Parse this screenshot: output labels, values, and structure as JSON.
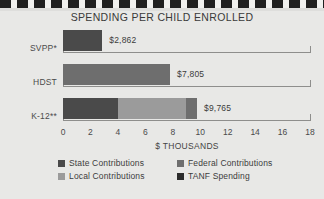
{
  "chart_data": {
    "type": "bar",
    "orientation": "horizontal",
    "stacked": true,
    "title": "SPENDING PER CHILD ENROLLED",
    "xlabel": "$ THOUSANDS",
    "ylabel": "",
    "xlim": [
      0,
      18
    ],
    "xticks": [
      0,
      2,
      4,
      6,
      8,
      10,
      12,
      14,
      16,
      18
    ],
    "xtick_labels": [
      "0",
      "2",
      "4",
      "6",
      "8",
      "10",
      "12",
      "14",
      "16",
      "18"
    ],
    "grid": false,
    "legend_position": "bottom",
    "categories": [
      "SVPP*",
      "HDST",
      "K-12**"
    ],
    "value_labels": [
      "$2,862",
      "$7,805",
      "$9,765"
    ],
    "totals": [
      2.862,
      7.805,
      9.765
    ],
    "series": [
      {
        "name": "State Contributions",
        "color": "#4a4a4a",
        "values": [
          2.862,
          0.0,
          4.0
        ]
      },
      {
        "name": "Local Contributions",
        "color": "#9b9b9b",
        "values": [
          0.0,
          0.0,
          4.95
        ]
      },
      {
        "name": "Federal Contributions",
        "color": "#6e6e6e",
        "values": [
          0.0,
          7.805,
          0.815
        ]
      },
      {
        "name": "TANF Spending",
        "color": "#2b2b2b",
        "values": [
          0.0,
          0.0,
          0.0
        ]
      }
    ],
    "legend": [
      {
        "label": "State Contributions",
        "color": "#4a4a4a"
      },
      {
        "label": "Federal Contributions",
        "color": "#6e6e6e"
      },
      {
        "label": "Local Contributions",
        "color": "#9b9b9b"
      },
      {
        "label": "TANF Spending",
        "color": "#2b2b2b"
      }
    ],
    "colors": {
      "background": "#e8e8e6",
      "axis": "#8e8e8c",
      "text": "#3c3c3c",
      "state": "#4a4a4a",
      "local": "#9b9b9b",
      "federal": "#6e6e6e",
      "tanf": "#2b2b2b"
    }
  }
}
